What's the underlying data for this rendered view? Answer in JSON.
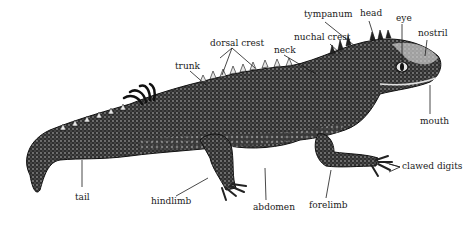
{
  "diagram": {
    "colors": {
      "ink": "#1a1a1a",
      "body_dark": "#2b2b2b",
      "body_mid": "#555555",
      "highlight": "#d9d9d9",
      "background": "#ffffff"
    },
    "labels": [
      {
        "id": "tympanum",
        "text": "tympanum",
        "x": 304,
        "y": 12
      },
      {
        "id": "head",
        "text": "head",
        "x": 360,
        "y": 10
      },
      {
        "id": "eye",
        "text": "eye",
        "x": 396,
        "y": 14
      },
      {
        "id": "nostril",
        "text": "nostril",
        "x": 418,
        "y": 29
      },
      {
        "id": "nuchal-crest",
        "text": "nuchal crest",
        "x": 294,
        "y": 34
      },
      {
        "id": "dorsal-crest",
        "text": "dorsal crest",
        "x": 210,
        "y": 39
      },
      {
        "id": "neck",
        "text": "neck",
        "x": 274,
        "y": 46
      },
      {
        "id": "trunk",
        "text": "trunk",
        "x": 175,
        "y": 62
      },
      {
        "id": "mouth",
        "text": "mouth",
        "x": 420,
        "y": 120
      },
      {
        "id": "clawed-digits",
        "text": "clawed digits",
        "x": 402,
        "y": 164
      },
      {
        "id": "tail",
        "text": "tail",
        "x": 75,
        "y": 194
      },
      {
        "id": "hindlimb",
        "text": "hindlimb",
        "x": 151,
        "y": 199
      },
      {
        "id": "abdomen",
        "text": "abdomen",
        "x": 253,
        "y": 205
      },
      {
        "id": "forelimb",
        "text": "forelimb",
        "x": 309,
        "y": 203
      }
    ]
  }
}
